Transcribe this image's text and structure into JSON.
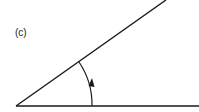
{
  "figure": {
    "label": "(c)",
    "colors": {
      "stroke": "#1a1a1a",
      "background": "#ffffff",
      "text": "#222222"
    },
    "vertex": {
      "x": 16,
      "y": 106
    },
    "horizontal_ray_end": {
      "x": 199,
      "y": 106
    },
    "inclined_ray_end": {
      "x": 166,
      "y": 0
    },
    "arc": {
      "start": {
        "x": 92,
        "y": 106
      },
      "end": {
        "x": 79,
        "y": 62
      },
      "arrow_direction": "counter-clockwise"
    }
  }
}
